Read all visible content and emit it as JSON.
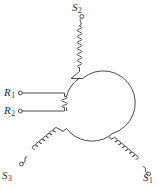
{
  "figure": {
    "type": "electrical-schematic",
    "background_color": "#fefefe",
    "line_color": "#4a4a4a"
  },
  "labels": {
    "s1": {
      "base": "S",
      "sub": "1"
    },
    "s2": {
      "base": "S",
      "sub": "2"
    },
    "s3": {
      "base": "S",
      "sub": "3"
    },
    "r1": {
      "base": "R",
      "sub": "1"
    },
    "r2": {
      "base": "R",
      "sub": "2"
    }
  },
  "components": {
    "hub_name": "rotor-circle",
    "stator_coil_count": 3,
    "rotor_coil_count": 1,
    "terminal_count": 5
  }
}
